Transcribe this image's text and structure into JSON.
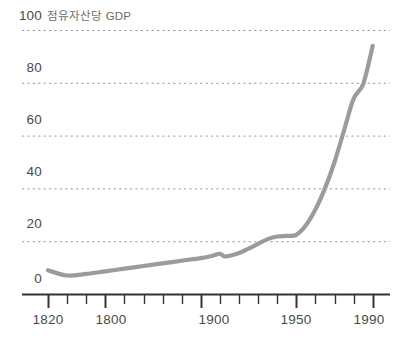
{
  "chart_data": {
    "type": "line",
    "title": "점유자산당 GDP",
    "xlabel": "",
    "ylabel": "",
    "grid": true,
    "legend": false,
    "line_color": "#9b9b9b",
    "axis_color": "#333333",
    "gridline_color": "#9a9a9a",
    "text_color": "#4a4a4a",
    "background": "#ffffff",
    "xlim": [
      1820,
      1998
    ],
    "ylim": [
      0,
      100
    ],
    "y_ticks": [
      0,
      20,
      40,
      60,
      80,
      100
    ],
    "y_tick_labels": [
      "0",
      "20",
      "40",
      "60",
      "80",
      "100"
    ],
    "x_tick_labels": [
      "1820",
      "1800",
      "1900",
      "1950",
      "1990"
    ],
    "x_tick_values": [
      1820,
      1850,
      1900,
      1950,
      1990
    ],
    "x_minor_tick_values": [
      1830,
      1840,
      1860,
      1870,
      1880,
      1890,
      1910,
      1920,
      1930,
      1940,
      1960,
      1970,
      1980
    ],
    "x": [
      1820,
      1830,
      1840,
      1850,
      1860,
      1870,
      1880,
      1890,
      1900,
      1905,
      1910,
      1913,
      1920,
      1925,
      1930,
      1935,
      1940,
      1945,
      1950,
      1955,
      1960,
      1965,
      1970,
      1975,
      1980,
      1985,
      1990
    ],
    "values": [
      9.0,
      7.0,
      7.6,
      8.6,
      9.6,
      10.6,
      11.6,
      12.6,
      13.6,
      14.3,
      15.2,
      14.2,
      15.5,
      17.2,
      19.0,
      20.8,
      21.8,
      22.0,
      22.4,
      26.0,
      32.0,
      40.0,
      50.0,
      62.0,
      74.0,
      79.5,
      94.0
    ]
  },
  "y_axis": {
    "ticks": [
      {
        "label": "100"
      },
      {
        "label": "80"
      },
      {
        "label": "60"
      },
      {
        "label": "40"
      },
      {
        "label": "20"
      },
      {
        "label": "0"
      }
    ]
  },
  "x_axis": {
    "ticks": [
      {
        "label": "1820"
      },
      {
        "label": "1800"
      },
      {
        "label": "1900"
      },
      {
        "label": "1950"
      },
      {
        "label": "1990"
      }
    ]
  }
}
